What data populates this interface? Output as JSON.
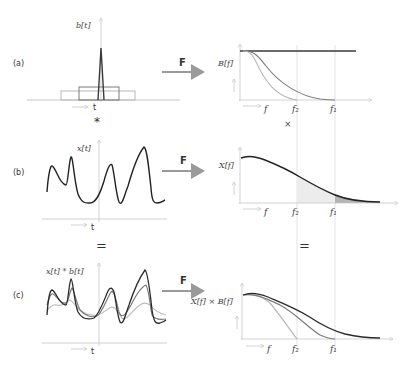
{
  "colors": {
    "dark": "#3a3a3a",
    "mid": "#7a7a7a",
    "light": "#b8b8b8",
    "axis": "#c8c8c8",
    "guide": "#d8d8d8",
    "arrow": "#9a9a9a",
    "fill_light": "#e8e8e8",
    "fill_dark": "#b0b0b0"
  },
  "panels": {
    "a": {
      "label": "(a)",
      "time_ylabel": "b[t]",
      "time_xlabel": "t",
      "transform": "F",
      "freq_ylabel": "B[f]",
      "freq_xlabel": "f",
      "freq_ticks": [
        "f₂",
        "f₁"
      ]
    },
    "b": {
      "label": "(b)",
      "time_ylabel": "x[t]",
      "time_xlabel": "t",
      "transform": "F",
      "freq_ylabel": "X[f]",
      "freq_xlabel": "f",
      "freq_ticks": [
        "f₂",
        "f₁"
      ]
    },
    "c": {
      "label": "(c)",
      "time_ylabel": "x[t] * b[t]",
      "time_xlabel": "t",
      "transform": "F",
      "freq_ylabel": "X[f] × B[f]",
      "freq_xlabel": "f",
      "freq_ticks": [
        "f₂",
        "f₁"
      ]
    }
  },
  "operators": {
    "convolution": "*",
    "multiplication": "×",
    "equals_left": "=",
    "equals_right": "="
  }
}
